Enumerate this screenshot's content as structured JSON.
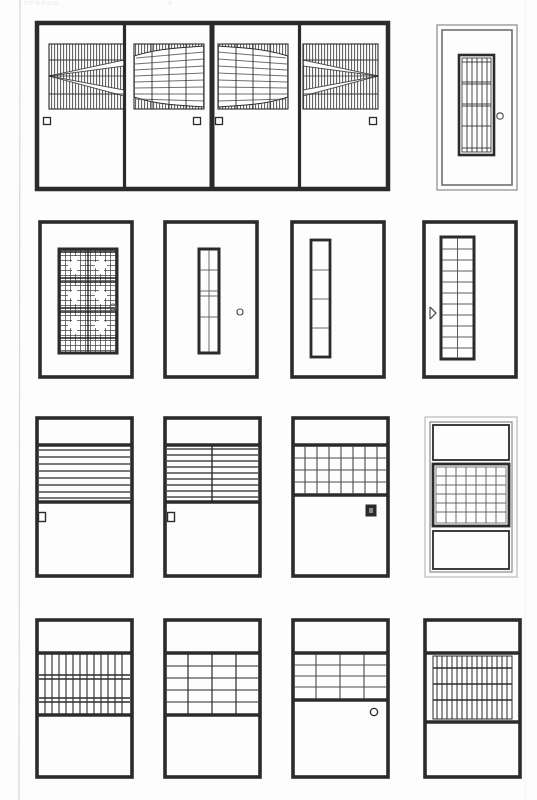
{
  "sheet": {
    "title": "Door and window elevation plate",
    "background_color": "#fdfdfd",
    "ink_color": "#2b2b2b",
    "light_ink_color": "#6f6f6f",
    "page_edge_color": "#d8d8d8",
    "width": 537,
    "height": 800,
    "header_left": "ПРИЛОЖ.",
    "header_right": "А"
  },
  "rows": [
    {
      "id": "row-1",
      "label": "Row 1 — four-leaf assembly with fan grille panels, plus single door",
      "items": [
        {
          "id": "r1-leaf-1",
          "label": "Leaf 1 — wedge fan grille, square handle left"
        },
        {
          "id": "r1-leaf-2",
          "label": "Leaf 2 — lens grille, square handle right"
        },
        {
          "id": "r1-leaf-3",
          "label": "Leaf 3 — lens grille, square handle left"
        },
        {
          "id": "r1-leaf-4",
          "label": "Leaf 4 — wedge fan grille, square handle right"
        },
        {
          "id": "r1-door-5",
          "label": "Single door — tall barred vision panel, round knob"
        }
      ]
    },
    {
      "id": "row-2",
      "label": "Row 2 — vision-panel doors",
      "items": [
        {
          "id": "r2-door-1",
          "label": "Door — dense crosshatch decorative grille, round knob"
        },
        {
          "id": "r2-door-2",
          "label": "Door — narrow 1x5 slot panel, round knob"
        },
        {
          "id": "r2-door-3",
          "label": "Door — narrow 1x4 slot panel"
        },
        {
          "id": "r2-door-4",
          "label": "Door — 2x11 barred panel, lever handle"
        }
      ]
    },
    {
      "id": "row-3",
      "label": "Row 3 — transom / louver doors",
      "items": [
        {
          "id": "r3-door-1",
          "label": "Door — horizontal louver band, square handle"
        },
        {
          "id": "r3-door-2",
          "label": "Door — split horizontal louver band, square handle"
        },
        {
          "id": "r3-door-3",
          "label": "Door — 7x4 barred panel, dark square handle"
        },
        {
          "id": "r3-unit-4",
          "label": "Window unit — three lights, centre 7x6 grille"
        }
      ]
    },
    {
      "id": "row-4",
      "label": "Row 4 — mid-panel grille doors",
      "items": [
        {
          "id": "r4-door-1",
          "label": "Door — dense vertical bar panel with three rails"
        },
        {
          "id": "r4-door-2",
          "label": "Door — 4x5 grid panel"
        },
        {
          "id": "r4-door-3",
          "label": "Door — 4x4 grid panel, round knob"
        },
        {
          "id": "r4-unit-4",
          "label": "Unit — dense vertical bar panel with four rails"
        }
      ]
    }
  ],
  "legend": {
    "handle_square": "square-handle",
    "handle_round": "round-knob",
    "handle_lever": "lever-handle",
    "handle_dark": "dark-square-handle"
  }
}
